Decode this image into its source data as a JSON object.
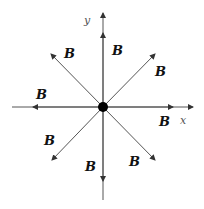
{
  "diagram": {
    "axes": {
      "x_label": "x",
      "y_label": "y"
    },
    "field_label": "B",
    "labels": [
      {
        "id": "b_up",
        "text": "B"
      },
      {
        "id": "b_upright",
        "text": "B"
      },
      {
        "id": "b_right",
        "text": "B"
      },
      {
        "id": "b_downright",
        "text": "B"
      },
      {
        "id": "b_down",
        "text": "B"
      },
      {
        "id": "b_downleft",
        "text": "B"
      },
      {
        "id": "b_left",
        "text": "B"
      },
      {
        "id": "b_upleft",
        "text": "B"
      }
    ],
    "colors": {
      "line": "#555555",
      "charge": "#000000"
    }
  }
}
